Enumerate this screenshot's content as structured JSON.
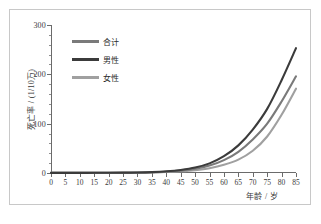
{
  "figure": {
    "border_color": "#c8c8c8",
    "background": "#ffffff"
  },
  "chart_data": {
    "type": "line",
    "title": "",
    "subtitle": "",
    "xlabel": "年龄 / 岁",
    "ylabel": "死亡率 / (1/10万)",
    "xlim": [
      0,
      85
    ],
    "ylim": [
      0,
      300
    ],
    "xticks": [
      0,
      5,
      10,
      15,
      20,
      25,
      30,
      35,
      40,
      45,
      50,
      55,
      60,
      65,
      70,
      75,
      80,
      85
    ],
    "yticks": [
      0,
      100,
      200,
      300
    ],
    "xtick_labels": [
      "0",
      "5",
      "10",
      "15",
      "20",
      "25",
      "30",
      "35",
      "40",
      "45",
      "50",
      "55",
      "60",
      "65",
      "70",
      "75",
      "80",
      "85"
    ],
    "ytick_labels": [
      "0",
      "100",
      "200",
      "300"
    ],
    "grid": false,
    "legend_position": "upper-left-inside",
    "x": [
      0,
      5,
      10,
      15,
      20,
      25,
      30,
      35,
      40,
      45,
      50,
      55,
      60,
      65,
      70,
      75,
      80,
      85
    ],
    "series": [
      {
        "name": "合计",
        "color": "#7a7a7a",
        "values": [
          0.2,
          0.2,
          0.2,
          0.3,
          0.4,
          0.5,
          0.8,
          1.4,
          2.6,
          4.8,
          8.5,
          15.0,
          26.0,
          43.0,
          68.0,
          100.0,
          145.0,
          196.0
        ]
      },
      {
        "name": "男性",
        "color": "#3b3b3b",
        "values": [
          0.2,
          0.2,
          0.3,
          0.4,
          0.5,
          0.7,
          1.0,
          1.8,
          3.4,
          6.2,
          11.0,
          19.5,
          34.0,
          56.0,
          88.0,
          130.0,
          188.0,
          253.0
        ]
      },
      {
        "name": "女性",
        "color": "#a0a0a0",
        "values": [
          0.2,
          0.2,
          0.2,
          0.2,
          0.3,
          0.4,
          0.6,
          1.0,
          1.9,
          3.4,
          5.8,
          9.8,
          16.5,
          27.0,
          45.0,
          74.0,
          118.0,
          171.0
        ]
      }
    ]
  },
  "legend": {
    "items": [
      {
        "label": "合计",
        "color": "#7a7a7a"
      },
      {
        "label": "男性",
        "color": "#3b3b3b"
      },
      {
        "label": "女性",
        "color": "#a0a0a0"
      }
    ]
  }
}
